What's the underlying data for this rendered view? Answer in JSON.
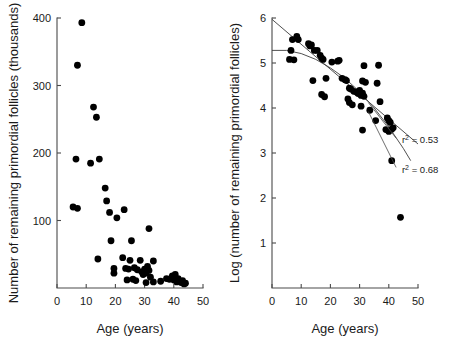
{
  "figure": {
    "background": "#ffffff",
    "point_color": "#000000",
    "axis_color": "#4a4a4a",
    "line_color": "#3c3c3c"
  },
  "chart_data": [
    {
      "id": "left-panel",
      "type": "scatter",
      "title": "",
      "xlabel": "Age (years)",
      "ylabel": "Number of remaining primordial follicles (thousands)",
      "xlim": [
        0,
        50
      ],
      "ylim": [
        0,
        400
      ],
      "xticks": [
        0,
        10,
        20,
        30,
        40,
        50
      ],
      "yticks": [
        100,
        200,
        300,
        400
      ],
      "xtick_labels": [
        "0",
        "10",
        "20",
        "30",
        "40",
        "50"
      ],
      "ytick_labels": [
        "100",
        "200",
        "300",
        "400"
      ],
      "grid": false,
      "legend": "none",
      "points": [
        {
          "x": 8.5,
          "y": 393
        },
        {
          "x": 7.0,
          "y": 330
        },
        {
          "x": 12.5,
          "y": 268
        },
        {
          "x": 13.5,
          "y": 253
        },
        {
          "x": 6.5,
          "y": 191
        },
        {
          "x": 11.5,
          "y": 185
        },
        {
          "x": 14.5,
          "y": 191
        },
        {
          "x": 5.5,
          "y": 120
        },
        {
          "x": 7.0,
          "y": 118
        },
        {
          "x": 16.5,
          "y": 148
        },
        {
          "x": 17.0,
          "y": 129
        },
        {
          "x": 18.0,
          "y": 112
        },
        {
          "x": 20.5,
          "y": 104
        },
        {
          "x": 23.0,
          "y": 116
        },
        {
          "x": 31.5,
          "y": 88
        },
        {
          "x": 18.5,
          "y": 70
        },
        {
          "x": 25.5,
          "y": 70
        },
        {
          "x": 14.0,
          "y": 43
        },
        {
          "x": 22.5,
          "y": 45
        },
        {
          "x": 25.0,
          "y": 41
        },
        {
          "x": 28.5,
          "y": 41
        },
        {
          "x": 33.0,
          "y": 40
        },
        {
          "x": 19.5,
          "y": 29
        },
        {
          "x": 19.5,
          "y": 22
        },
        {
          "x": 23.5,
          "y": 29
        },
        {
          "x": 24.5,
          "y": 28
        },
        {
          "x": 26.5,
          "y": 30
        },
        {
          "x": 27.5,
          "y": 27
        },
        {
          "x": 29.0,
          "y": 24
        },
        {
          "x": 29.5,
          "y": 20
        },
        {
          "x": 30.0,
          "y": 28
        },
        {
          "x": 30.5,
          "y": 22
        },
        {
          "x": 31.0,
          "y": 32
        },
        {
          "x": 31.5,
          "y": 26
        },
        {
          "x": 32.0,
          "y": 16
        },
        {
          "x": 24.0,
          "y": 12
        },
        {
          "x": 26.0,
          "y": 13
        },
        {
          "x": 27.0,
          "y": 11
        },
        {
          "x": 30.5,
          "y": 8
        },
        {
          "x": 33.0,
          "y": 9
        },
        {
          "x": 35.5,
          "y": 10
        },
        {
          "x": 37.5,
          "y": 14
        },
        {
          "x": 38.5,
          "y": 13
        },
        {
          "x": 39.5,
          "y": 18
        },
        {
          "x": 40.0,
          "y": 12
        },
        {
          "x": 40.5,
          "y": 20
        },
        {
          "x": 41.0,
          "y": 9
        },
        {
          "x": 41.5,
          "y": 14
        },
        {
          "x": 42.5,
          "y": 8
        },
        {
          "x": 43.0,
          "y": 11
        },
        {
          "x": 43.5,
          "y": 6
        },
        {
          "x": 44.0,
          "y": 7
        }
      ]
    },
    {
      "id": "right-panel",
      "type": "scatter",
      "title": "",
      "xlabel": "Age (years)",
      "ylabel": "Log (number of remaining primordial follicles)",
      "xlim": [
        0,
        50
      ],
      "ylim": [
        0,
        6
      ],
      "xticks": [
        0,
        10,
        20,
        30,
        40,
        50
      ],
      "yticks": [
        1,
        2,
        3,
        4,
        5,
        6
      ],
      "xtick_labels": [
        "0",
        "10",
        "20",
        "30",
        "40",
        "50"
      ],
      "ytick_labels": [
        "1",
        "2",
        "3",
        "4",
        "5",
        "6"
      ],
      "grid": false,
      "legend": "none",
      "points": [
        {
          "x": 8.5,
          "y": 5.59
        },
        {
          "x": 9.0,
          "y": 5.52
        },
        {
          "x": 7.0,
          "y": 5.52
        },
        {
          "x": 12.5,
          "y": 5.43
        },
        {
          "x": 13.5,
          "y": 5.4
        },
        {
          "x": 13.0,
          "y": 5.38
        },
        {
          "x": 14.5,
          "y": 5.28
        },
        {
          "x": 15.5,
          "y": 5.28
        },
        {
          "x": 6.5,
          "y": 5.28
        },
        {
          "x": 16.5,
          "y": 5.17
        },
        {
          "x": 17.0,
          "y": 5.11
        },
        {
          "x": 17.5,
          "y": 5.08
        },
        {
          "x": 6.0,
          "y": 5.08
        },
        {
          "x": 7.5,
          "y": 5.07
        },
        {
          "x": 20.5,
          "y": 5.02
        },
        {
          "x": 22.5,
          "y": 5.04
        },
        {
          "x": 23.0,
          "y": 5.06
        },
        {
          "x": 31.5,
          "y": 4.94
        },
        {
          "x": 36.5,
          "y": 4.95
        },
        {
          "x": 14.0,
          "y": 4.61
        },
        {
          "x": 18.5,
          "y": 4.66
        },
        {
          "x": 24.0,
          "y": 4.66
        },
        {
          "x": 25.0,
          "y": 4.63
        },
        {
          "x": 25.5,
          "y": 4.61
        },
        {
          "x": 31.0,
          "y": 4.6
        },
        {
          "x": 32.0,
          "y": 4.57
        },
        {
          "x": 36.0,
          "y": 4.55
        },
        {
          "x": 17.0,
          "y": 4.3
        },
        {
          "x": 18.0,
          "y": 4.25
        },
        {
          "x": 26.5,
          "y": 4.44
        },
        {
          "x": 27.0,
          "y": 4.42
        },
        {
          "x": 28.0,
          "y": 4.37
        },
        {
          "x": 29.0,
          "y": 4.35
        },
        {
          "x": 29.5,
          "y": 4.32
        },
        {
          "x": 30.0,
          "y": 4.39
        },
        {
          "x": 30.5,
          "y": 4.28
        },
        {
          "x": 31.0,
          "y": 4.33
        },
        {
          "x": 31.5,
          "y": 4.26
        },
        {
          "x": 26.0,
          "y": 4.2
        },
        {
          "x": 26.5,
          "y": 4.12
        },
        {
          "x": 27.5,
          "y": 4.07
        },
        {
          "x": 30.5,
          "y": 4.04
        },
        {
          "x": 37.0,
          "y": 4.14
        },
        {
          "x": 33.5,
          "y": 3.95
        },
        {
          "x": 35.5,
          "y": 3.72
        },
        {
          "x": 31.0,
          "y": 3.51
        },
        {
          "x": 39.5,
          "y": 3.78
        },
        {
          "x": 40.0,
          "y": 3.72
        },
        {
          "x": 40.5,
          "y": 3.68
        },
        {
          "x": 39.0,
          "y": 3.52
        },
        {
          "x": 40.0,
          "y": 3.48
        },
        {
          "x": 41.0,
          "y": 3.53
        },
        {
          "x": 41.5,
          "y": 3.56
        },
        {
          "x": 41.0,
          "y": 2.83
        },
        {
          "x": 44.0,
          "y": 1.57
        }
      ],
      "fits": [
        {
          "name": "linear-fit",
          "label": "r² = 0.53",
          "r_squared": 0.53,
          "kind": "line",
          "path": [
            {
              "x": 0.0,
              "y": 5.97
            },
            {
              "x": 50.0,
              "y": 3.2
            }
          ]
        },
        {
          "name": "quadratic-fit",
          "label": "r² = 0.68",
          "r_squared": 0.68,
          "kind": "curve",
          "path": [
            {
              "x": 0.0,
              "y": 5.28
            },
            {
              "x": 5.0,
              "y": 5.28
            },
            {
              "x": 10.0,
              "y": 5.21
            },
            {
              "x": 15.0,
              "y": 5.08
            },
            {
              "x": 20.0,
              "y": 4.89
            },
            {
              "x": 25.0,
              "y": 4.66
            },
            {
              "x": 30.0,
              "y": 4.36
            },
            {
              "x": 35.0,
              "y": 4.0
            },
            {
              "x": 40.0,
              "y": 3.58
            },
            {
              "x": 45.0,
              "y": 3.1
            },
            {
              "x": 47.5,
              "y": 2.83
            }
          ]
        }
      ],
      "annotations": [
        {
          "name": "r2-linear-annotation",
          "base": "r",
          "sup": "2",
          "rest": " = 0.53",
          "text": "r² = 0.53",
          "label_x": 44.5,
          "label_y": 3.28,
          "leader_from": {
            "x": 33.0,
            "y": 4.12
          },
          "leader_to": {
            "x": 42.5,
            "y": 3.33
          }
        },
        {
          "name": "r2-quadratic-annotation",
          "base": "r",
          "sup": "2",
          "rest": " = 0.68",
          "text": "r² = 0.68",
          "label_x": 44.5,
          "label_y": 2.62,
          "leader_from": {
            "x": 33.0,
            "y": 3.92
          },
          "leader_to": {
            "x": 42.5,
            "y": 2.68
          }
        }
      ]
    }
  ]
}
